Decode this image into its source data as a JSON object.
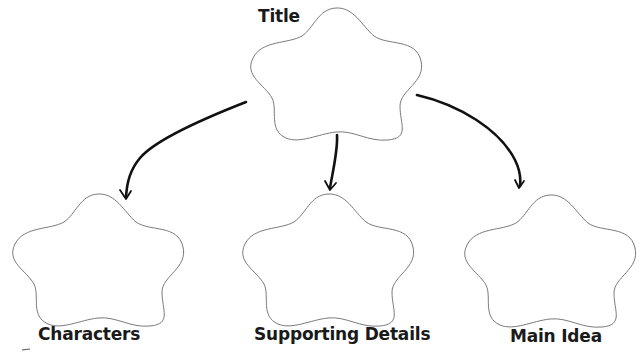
{
  "diagram": {
    "type": "graphic-organizer",
    "nodes": [
      {
        "id": "title",
        "label": "Title",
        "shape": "flower"
      },
      {
        "id": "characters",
        "label": "Characters",
        "shape": "flower"
      },
      {
        "id": "supporting_details",
        "label": "Supporting Details",
        "shape": "flower"
      },
      {
        "id": "main_idea",
        "label": "Main Idea",
        "shape": "flower"
      }
    ],
    "edges": [
      {
        "from": "title",
        "to": "characters"
      },
      {
        "from": "title",
        "to": "supporting_details"
      },
      {
        "from": "title",
        "to": "main_idea"
      }
    ]
  },
  "labels": {
    "title": "Title",
    "characters": "Characters",
    "supporting_details": "Supporting Details",
    "main_idea": "Main Idea"
  },
  "colors": {
    "outline": "#7a7a7a",
    "arrow": "#111111",
    "text": "#1a1a1a",
    "background": "#ffffff"
  }
}
